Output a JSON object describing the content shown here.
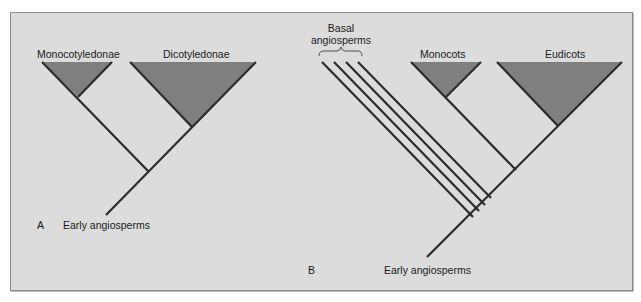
{
  "panel_a": {
    "letter": "A",
    "clade_left": "Monocotyledonae",
    "clade_right": "Dicotyledonae",
    "root_label": "Early angiosperms"
  },
  "panel_b": {
    "letter": "B",
    "basal_label_line1": "Basal",
    "basal_label_line2": "angiosperms",
    "clade_middle": "Monocots",
    "clade_right": "Eudicots",
    "root_label": "Early angiosperms",
    "basal_lineage_count": 4
  },
  "colors": {
    "background": "#dcdcdc",
    "triangle_fill": "#7f7f7f",
    "branch": "#2b2b2b",
    "frame_border": "#8a8a8a"
  }
}
